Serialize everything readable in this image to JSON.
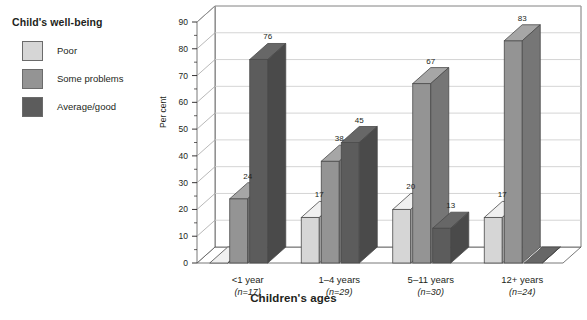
{
  "legend": {
    "title": "Child's well-being",
    "items": [
      {
        "label": "Poor",
        "color": "#d6d6d6"
      },
      {
        "label": "Some problems",
        "color": "#949494"
      },
      {
        "label": "Average/good",
        "color": "#5c5c5c"
      }
    ]
  },
  "chart_data": {
    "type": "bar",
    "title": "",
    "xlabel": "Children's ages",
    "ylabel": "Per cent",
    "ylim": [
      0,
      90
    ],
    "yticks": [
      0,
      10,
      20,
      30,
      40,
      50,
      60,
      70,
      80,
      90
    ],
    "grid": true,
    "legend_position": "top-left",
    "categories": [
      "<1 year",
      "1–4 years",
      "5–11 years",
      "12+ years"
    ],
    "category_sublabels": [
      "(n=17)",
      "(n=29)",
      "(n=30)",
      "(n=24)"
    ],
    "series": [
      {
        "name": "Poor",
        "color": "#d6d6d6",
        "values": [
          0,
          17,
          20,
          17
        ]
      },
      {
        "name": "Some problems",
        "color": "#949494",
        "values": [
          24,
          38,
          67,
          83
        ]
      },
      {
        "name": "Average/good",
        "color": "#5c5c5c",
        "values": [
          76,
          45,
          13,
          0
        ]
      }
    ],
    "value_labels": [
      {
        "group": 0,
        "series": 1,
        "text": "24"
      },
      {
        "group": 0,
        "series": 2,
        "text": "76"
      },
      {
        "group": 1,
        "series": 0,
        "text": "17"
      },
      {
        "group": 1,
        "series": 1,
        "text": "38"
      },
      {
        "group": 1,
        "series": 2,
        "text": "45"
      },
      {
        "group": 2,
        "series": 0,
        "text": "20"
      },
      {
        "group": 2,
        "series": 1,
        "text": "67"
      },
      {
        "group": 2,
        "series": 2,
        "text": "13"
      },
      {
        "group": 3,
        "series": 0,
        "text": "17"
      },
      {
        "group": 3,
        "series": 1,
        "text": "83"
      }
    ]
  }
}
